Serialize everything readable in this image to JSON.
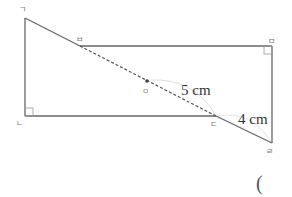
{
  "diagram": {
    "type": "geometry-figure",
    "colors": {
      "line": "#666666",
      "dashed": "#555555",
      "arc": "#dddddd",
      "label": "#777777",
      "text": "#333333"
    },
    "points": {
      "giyeok": {
        "label": "ㄱ",
        "x": 25,
        "y": 18
      },
      "nieun": {
        "label": "ㄴ",
        "x": 25,
        "y": 116
      },
      "digeut": {
        "label": "ㄷ",
        "x": 216,
        "y": 116
      },
      "rieul": {
        "label": "ㄹ",
        "x": 272,
        "y": 143
      },
      "mieum": {
        "label": "ㅁ",
        "x": 272,
        "y": 46
      },
      "bieup": {
        "label": "ㅂ",
        "x": 80,
        "y": 46
      },
      "ieung": {
        "label": "ㅇ",
        "x": 147,
        "y": 81
      }
    },
    "measurements": {
      "oc_length": "5 cm",
      "cr_length": "4 cm"
    },
    "answer_blank": "("
  }
}
